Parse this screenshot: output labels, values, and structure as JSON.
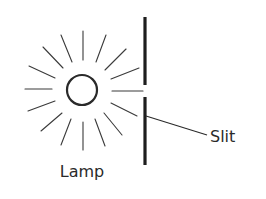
{
  "diagram": {
    "type": "optics-schematic",
    "labels": {
      "lamp": "Lamp",
      "slit": "Slit"
    },
    "components": [
      {
        "name": "lamp",
        "shape": "circle with 16 radiating rays",
        "center": [
          82,
          90
        ],
        "radius": 15
      },
      {
        "name": "barrier",
        "shape": "vertical opaque screen with gap",
        "x": 145,
        "segments": [
          [
            17,
            85
          ],
          [
            97,
            165
          ]
        ]
      },
      {
        "name": "slit",
        "shape": "gap in barrier",
        "y_range": [
          85,
          97
        ]
      },
      {
        "name": "transmitted-ray",
        "shape": "horizontal line through slit"
      }
    ],
    "colors": {
      "stroke": "#2a2a2a",
      "background": "#ffffff"
    }
  }
}
